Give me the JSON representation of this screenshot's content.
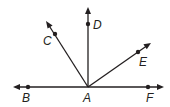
{
  "diagram": {
    "colors": {
      "stroke": "#231f20",
      "background": "#ffffff"
    },
    "vertex": {
      "label": "A",
      "x": 88,
      "y": 87
    },
    "rays": [
      {
        "name": "AB",
        "point_label": "B",
        "point": [
          28,
          87
        ],
        "tip": [
          13,
          87
        ]
      },
      {
        "name": "AC",
        "point_label": "C",
        "point": [
          55,
          34
        ],
        "tip": [
          46,
          21
        ]
      },
      {
        "name": "AD",
        "point_label": "D",
        "point": [
          88,
          24
        ],
        "tip": [
          88,
          7
        ]
      },
      {
        "name": "AE",
        "point_label": "E",
        "point": [
          138,
          52
        ],
        "tip": [
          151,
          43
        ]
      },
      {
        "name": "AF",
        "point_label": "F",
        "point": [
          148,
          87
        ],
        "tip": [
          164,
          87
        ]
      }
    ],
    "labels": {
      "A": "A",
      "B": "B",
      "C": "C",
      "D": "D",
      "E": "E",
      "F": "F"
    }
  }
}
